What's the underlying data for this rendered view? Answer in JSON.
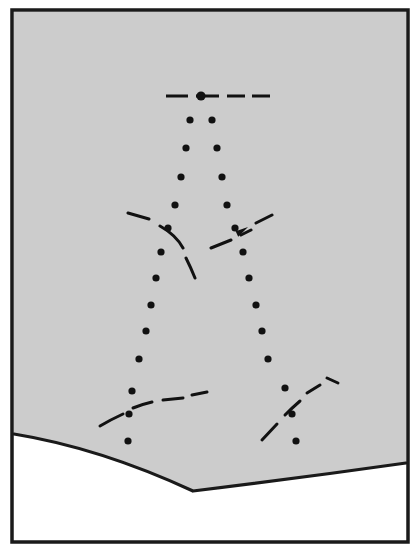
{
  "figure": {
    "title": "",
    "caption": "",
    "domain_note": "line-drawing technical figure: dotted point rows, dashed contour traces, directional arrow, and a curved lower boundary"
  },
  "colors": {
    "page_background": "#ffffff",
    "panel_fill": "#cccccc",
    "frame_stroke": "#1a1a1a",
    "mark_stroke": "#111111",
    "boundary_stroke": "#1a1a1a"
  },
  "frame": {
    "name": "outer-frame",
    "x": 12,
    "y": 10,
    "width": 396,
    "height": 532,
    "stroke_width": 3.5
  },
  "panel": {
    "name": "shaded-panel",
    "x": 14,
    "y": 12,
    "width": 392,
    "height": 452,
    "fill": "#cccccc"
  },
  "lower_boundary": {
    "name": "curved-lower-boundary",
    "description": "V-shaped concave boundary separating the shaded panel from the white area below",
    "stroke_width": 3.2,
    "left_end": [
      14,
      434
    ],
    "vertex": [
      193,
      491
    ],
    "right_end": [
      406,
      463
    ],
    "left_control": [
      100,
      448
    ],
    "right_control": [
      300,
      478
    ]
  },
  "dot_columns": [
    {
      "name": "left-dot-column",
      "radius": 3.6,
      "points": [
        [
          190,
          120
        ],
        [
          186,
          148
        ],
        [
          181,
          177
        ],
        [
          175,
          205
        ],
        [
          168,
          228
        ],
        [
          161,
          252
        ],
        [
          156,
          278
        ],
        [
          151,
          305
        ],
        [
          146,
          331
        ],
        [
          139,
          359
        ],
        [
          132,
          391
        ],
        [
          129,
          414
        ],
        [
          128,
          441
        ]
      ]
    },
    {
      "name": "right-dot-column",
      "radius": 3.6,
      "points": [
        [
          212,
          120
        ],
        [
          217,
          148
        ],
        [
          222,
          177
        ],
        [
          227,
          205
        ],
        [
          235,
          228
        ],
        [
          243,
          252
        ],
        [
          249,
          278
        ],
        [
          256,
          305
        ],
        [
          262,
          331
        ],
        [
          268,
          359
        ],
        [
          285,
          388
        ],
        [
          292,
          414
        ],
        [
          296,
          441
        ]
      ]
    }
  ],
  "hub_dot": {
    "name": "center-hub-dot",
    "x": 201,
    "y": 96,
    "radius": 4.6
  },
  "top_dashed_line": {
    "name": "top-horizontal-dashed-line",
    "y": 96,
    "stroke_width": 3.0,
    "segments": [
      [
        166,
        188
      ],
      [
        196,
        219
      ],
      [
        227,
        245
      ],
      [
        252,
        270
      ]
    ]
  },
  "dashed_curves": [
    {
      "name": "upper-left-dash-arc",
      "stroke_width": 3.0,
      "path": "M 128 213 L 149 219 M 160 226 Q 176 235 183 248 M 186 258 Q 191 268 195 278",
      "note": "short dashes forming a concave arc to the left of center"
    },
    {
      "name": "upper-right-dash-arrow",
      "stroke_width": 3.0,
      "path": "M 211 248 L 231 240 M 241 235 L 251 230 M 256 223 L 272 215",
      "note": "dashed line rising to the right, carrying an arrowhead"
    },
    {
      "name": "lower-left-dash-arc",
      "stroke_width": 3.0,
      "path": "M 100 426 Q 110 420 123 414 M 133 408 Q 143 404 152 402 M 163 400 L 183 398 M 192 395 L 207 392",
      "note": "shallow dashed arc near the lower-left, crossing the dot column"
    },
    {
      "name": "lower-right-dash-arc",
      "stroke_width": 3.0,
      "path": "M 262 440 L 277 424 M 285 415 Q 292 408 300 401 M 307 393 L 320 385 M 327 378 L 338 383",
      "note": "dashed arc rising to the upper right near the lower-right dot column"
    }
  ],
  "arrowhead": {
    "name": "direction-arrowhead",
    "tip": [
      248,
      227
    ],
    "angle_deg": -26,
    "length": 13,
    "half_width": 4.4,
    "note": "solid arrowhead pointing up and to the right"
  },
  "labels": {
    "visible_text": []
  }
}
